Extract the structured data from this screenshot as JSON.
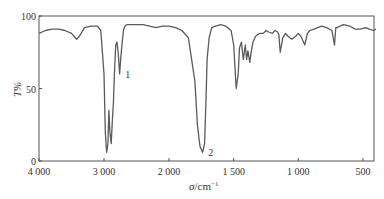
{
  "chart_data": {
    "type": "line",
    "title": "",
    "xlabel": "σ/cm⁻¹",
    "ylabel": "T%",
    "xlim": [
      4000,
      400
    ],
    "ylim": [
      0,
      100
    ],
    "x_axis_reversed": true,
    "x_scale_note": "scale doubles below 2000 cm⁻¹",
    "grid": false,
    "legend": null,
    "x_ticks": [
      "4 000",
      "3 000",
      "2 000",
      "1 500",
      "1 000",
      "500"
    ],
    "y_ticks": [
      "0",
      "50",
      "100"
    ],
    "series": [
      {
        "name": "IR spectrum",
        "x": [
          4000,
          3900,
          3800,
          3700,
          3600,
          3500,
          3420,
          3380,
          3300,
          3200,
          3100,
          3050,
          3000,
          2980,
          2960,
          2940,
          2925,
          2910,
          2890,
          2870,
          2855,
          2840,
          2820,
          2800,
          2780,
          2760,
          2740,
          2720,
          2700,
          2680,
          2650,
          2600,
          2500,
          2400,
          2300,
          2200,
          2100,
          2000,
          1950,
          1900,
          1850,
          1800,
          1780,
          1760,
          1740,
          1725,
          1715,
          1705,
          1690,
          1670,
          1640,
          1600,
          1560,
          1520,
          1500,
          1480,
          1465,
          1455,
          1440,
          1425,
          1410,
          1400,
          1390,
          1375,
          1365,
          1350,
          1330,
          1300,
          1270,
          1250,
          1230,
          1200,
          1180,
          1160,
          1150,
          1140,
          1120,
          1100,
          1080,
          1050,
          1020,
          1000,
          980,
          950,
          930,
          910,
          880,
          850,
          820,
          780,
          740,
          720,
          710,
          700,
          680,
          650,
          600,
          560,
          520,
          480,
          450,
          420,
          400
        ],
        "y": [
          88,
          90,
          91,
          91,
          90,
          88,
          84,
          86,
          92,
          93,
          93,
          90,
          60,
          20,
          6,
          12,
          35,
          20,
          12,
          30,
          40,
          60,
          80,
          82,
          74,
          60,
          72,
          82,
          90,
          93,
          94,
          94,
          94,
          94,
          93,
          92,
          93,
          93,
          92,
          90,
          85,
          55,
          25,
          10,
          6,
          12,
          40,
          70,
          85,
          92,
          93,
          94,
          93,
          90,
          80,
          50,
          60,
          78,
          82,
          70,
          80,
          70,
          76,
          68,
          75,
          82,
          86,
          88,
          88,
          90,
          89,
          88,
          90,
          89,
          87,
          75,
          85,
          88,
          86,
          84,
          86,
          88,
          86,
          80,
          88,
          90,
          91,
          92,
          93,
          92,
          90,
          80,
          92,
          92,
          93,
          94,
          93,
          91,
          91,
          92,
          91,
          90,
          91
        ],
        "color": "#555555"
      }
    ],
    "annotations": [
      {
        "label": "1",
        "x": 2720,
        "y": 60
      },
      {
        "label": "2",
        "x": 1720,
        "y": 6
      }
    ]
  },
  "axes": {
    "y_title": "T%",
    "x_title_main": "σ/cm",
    "x_title_sup": "−1"
  }
}
